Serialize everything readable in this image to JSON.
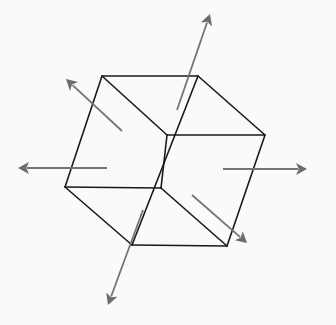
{
  "diagram": {
    "title": "",
    "background": "#fafafa",
    "edge_color": "#1a1a1a",
    "arrow_color": "#747474",
    "cube": {
      "vertices": {
        "top_left": [
          102,
          76
        ],
        "top_right": [
          198,
          76
        ],
        "right": [
          265,
          135
        ],
        "inner_top": [
          167,
          135
        ],
        "left": [
          65,
          187
        ],
        "inner_bottom": [
          161,
          188
        ],
        "bottom_left": [
          132,
          245
        ],
        "bottom_right": [
          227,
          246
        ]
      },
      "edges": [
        {
          "name": "top-edge",
          "from": [
            102,
            76
          ],
          "to": [
            198,
            76
          ]
        },
        {
          "name": "top-right-edge",
          "from": [
            198,
            76
          ],
          "to": [
            265,
            135
          ]
        },
        {
          "name": "middle-right-edge",
          "from": [
            265,
            135
          ],
          "to": [
            167,
            135
          ]
        },
        {
          "name": "top-diagonal-edge",
          "from": [
            102,
            76
          ],
          "to": [
            167,
            135
          ]
        },
        {
          "name": "left-edge",
          "from": [
            102,
            76
          ],
          "to": [
            65,
            187
          ]
        },
        {
          "name": "middle-left-edge",
          "from": [
            65,
            187
          ],
          "to": [
            161,
            188
          ]
        },
        {
          "name": "inner-vertical-edge",
          "from": [
            167,
            135
          ],
          "to": [
            161,
            188
          ]
        },
        {
          "name": "long-vertical-edge",
          "from": [
            198,
            76
          ],
          "to": [
            132,
            245
          ]
        },
        {
          "name": "lower-left-edge",
          "from": [
            65,
            187
          ],
          "to": [
            132,
            245
          ]
        },
        {
          "name": "bottom-edge",
          "from": [
            132,
            245
          ],
          "to": [
            227,
            246
          ]
        },
        {
          "name": "lower-diagonal-edge",
          "from": [
            161,
            188
          ],
          "to": [
            227,
            246
          ]
        },
        {
          "name": "right-edge",
          "from": [
            265,
            135
          ],
          "to": [
            227,
            246
          ]
        }
      ]
    },
    "arrows": [
      {
        "name": "arrow-up",
        "direction": "up",
        "from": [
          177,
          110
        ],
        "to": [
          210,
          14
        ]
      },
      {
        "name": "arrow-upper-left",
        "direction": "upper-left",
        "from": [
          122,
          131
        ],
        "to": [
          66,
          79
        ]
      },
      {
        "name": "arrow-left",
        "direction": "left",
        "from": [
          107,
          168
        ],
        "to": [
          18,
          168
        ]
      },
      {
        "name": "arrow-right",
        "direction": "right",
        "from": [
          223,
          169
        ],
        "to": [
          307,
          169
        ]
      },
      {
        "name": "arrow-lower-right",
        "direction": "lower-right",
        "from": [
          192,
          195
        ],
        "to": [
          247,
          243
        ]
      },
      {
        "name": "arrow-down",
        "direction": "down",
        "from": [
          143,
          210
        ],
        "to": [
          108,
          305
        ]
      }
    ]
  }
}
